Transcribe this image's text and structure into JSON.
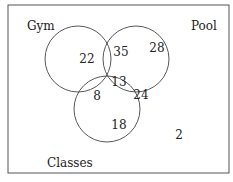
{
  "diagram": {
    "type": "venn-3",
    "sets": [
      {
        "name": "Gym",
        "cx": 78,
        "cy": 59,
        "r": 33
      },
      {
        "name": "Pool",
        "cx": 136,
        "cy": 59,
        "r": 33
      },
      {
        "name": "Classes",
        "cx": 107,
        "cy": 109,
        "r": 33
      }
    ],
    "regions": {
      "gym_only": "22",
      "pool_only": "28",
      "classes_only": "18",
      "gym_pool": "35",
      "gym_classes": "8",
      "pool_classes": "24",
      "all_three": "13",
      "none": "2"
    },
    "labels": {
      "gym": "Gym",
      "pool": "Pool",
      "classes": "Classes"
    }
  }
}
